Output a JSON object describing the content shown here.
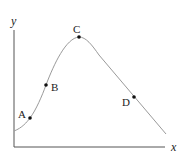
{
  "diagram": {
    "axes": {
      "x_label": "x",
      "y_label": "y",
      "color": "#555555"
    },
    "curve": {
      "color": "#9a9a9a",
      "description": "Rises from lower-left, peaks at C, then declines linearly to lower-right"
    },
    "points": [
      {
        "label": "A",
        "x": 30,
        "y": 118,
        "label_x": 18,
        "label_y": 118
      },
      {
        "label": "B",
        "x": 46,
        "y": 85,
        "label_x": 51,
        "label_y": 91
      },
      {
        "label": "C",
        "x": 79,
        "y": 37,
        "label_x": 73,
        "label_y": 33
      },
      {
        "label": "D",
        "x": 134,
        "y": 97,
        "label_x": 122,
        "label_y": 106
      }
    ],
    "point_color": "#111111"
  }
}
